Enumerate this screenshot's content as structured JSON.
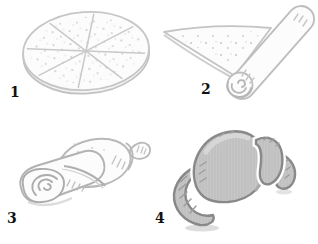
{
  "figure": {
    "name": "croissant-rolling-steps",
    "background": "#ffffff",
    "label_color": "#111111",
    "panels": [
      {
        "number": "1",
        "name": "dough-disc-cut-into-eight-wedges"
      },
      {
        "number": "2",
        "name": "dough-wedge-with-rolled-piece"
      },
      {
        "number": "3",
        "name": "wedge-rolled-into-log"
      },
      {
        "number": "4",
        "name": "baked-croissant"
      }
    ],
    "colors": {
      "line_light": "#c6c6c6",
      "line_mid": "#b2b2b2",
      "line_dark": "#8a8a8a",
      "fill_paper": "#fcfcfc",
      "fill_croissant": "#c6c6c6",
      "speckle": "#c9c9c9",
      "shadow": "#d4d4d4"
    }
  }
}
